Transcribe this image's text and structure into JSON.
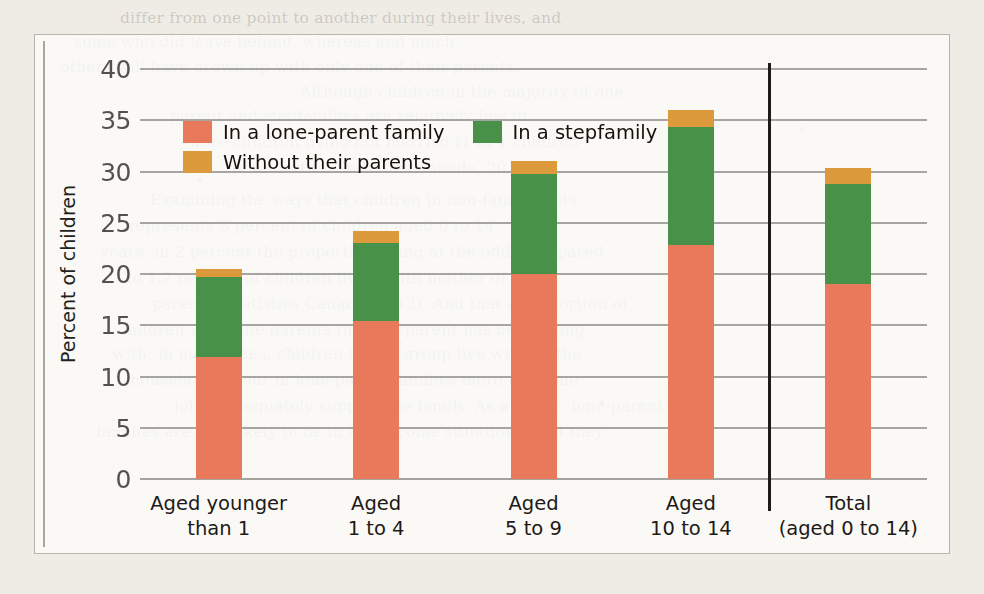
{
  "chart_data": {
    "type": "bar",
    "subtype": "stacked-vertical",
    "title": "",
    "xlabel": "",
    "ylabel": "Percent of children",
    "ylim": [
      0,
      40
    ],
    "yticks": [
      0,
      5,
      10,
      15,
      20,
      25,
      30,
      35,
      40
    ],
    "grid": true,
    "legend_position": "upper-left-inside",
    "categories": [
      "Aged younger\nthan 1",
      "Aged\n1 to 4",
      "Aged\n5 to 9",
      "Aged\n10 to 14",
      "Total\n(aged 0 to 14)"
    ],
    "category_lines": [
      [
        "Aged younger",
        "than 1"
      ],
      [
        "Aged",
        "1 to 4"
      ],
      [
        "Aged",
        "5 to 9"
      ],
      [
        "Aged",
        "10 to 14"
      ],
      [
        "Total",
        "(aged 0 to 14)"
      ]
    ],
    "series": [
      {
        "name": "In a lone-parent family",
        "color": "#e8795a",
        "values": [
          11.9,
          15.4,
          20.0,
          22.8,
          19.0
        ]
      },
      {
        "name": "In a stepfamily",
        "color": "#479149",
        "values": [
          7.8,
          7.6,
          9.8,
          11.5,
          9.8
        ]
      },
      {
        "name": "Without their parents",
        "color": "#dd9a3c",
        "values": [
          0.8,
          1.2,
          1.2,
          1.7,
          1.5
        ]
      }
    ],
    "totals": [
      20.5,
      24.2,
      31.0,
      36.0,
      30.3
    ],
    "divider_after_category_index": 3
  },
  "legend": {
    "rows": [
      [
        {
          "label": "In a lone-parent family",
          "swatch": "s0",
          "icon": "legend-swatch-lone-parent"
        },
        {
          "label": "In a stepfamily",
          "swatch": "s1",
          "icon": "legend-swatch-stepfamily"
        }
      ],
      [
        {
          "label": "Without their parents",
          "swatch": "s2",
          "icon": "legend-swatch-without-parents"
        }
      ]
    ]
  },
  "page_bleed": {
    "lines": [
      {
        "x": 120,
        "y": 6,
        "text": "differ from one point to another during their lives, and"
      },
      {
        "x": 74,
        "y": 30,
        "text": "some who did leave behind, whereas and much"
      },
      {
        "x": 60,
        "y": 55,
        "text": "others will have grown up with only one of their parents."
      },
      {
        "x": 300,
        "y": 80,
        "text": "Although children in the majority of one-"
      },
      {
        "x": 170,
        "y": 104,
        "text": "parent and stepfamilies are relatively few in"
      },
      {
        "x": 188,
        "y": 130,
        "text": "were children living not married (1 in 4 children"
      },
      {
        "x": 232,
        "y": 156,
        "text": "of all births, Statistics Canada, 2011)."
      },
      {
        "x": 150,
        "y": 188,
        "text": "Examining the ways that children in non-family units"
      },
      {
        "x": 128,
        "y": 214,
        "text": "represents 8 percent of children aged 0 to 14"
      },
      {
        "x": 100,
        "y": 240,
        "text": "years; in 2 percent the proportion living at the odds compared"
      },
      {
        "x": 126,
        "y": 266,
        "text": "to 1.2 percent of children living with neither of their"
      },
      {
        "x": 152,
        "y": 292,
        "text": "parents (Statistics Canada, 2012). And that a proportion of"
      },
      {
        "x": 118,
        "y": 318,
        "text": "children with lone parents that the parent has been living"
      },
      {
        "x": 112,
        "y": 342,
        "text": "with; in most cases, children in this group live with all the"
      },
      {
        "x": 130,
        "y": 368,
        "text": "household labour in lone-parent families more than one"
      },
      {
        "x": 174,
        "y": 394,
        "text": "job to adequately support the family. As a result, lone-parent"
      },
      {
        "x": 96,
        "y": 420,
        "text": "families are also likely to be in low-income situations, and they"
      }
    ]
  }
}
